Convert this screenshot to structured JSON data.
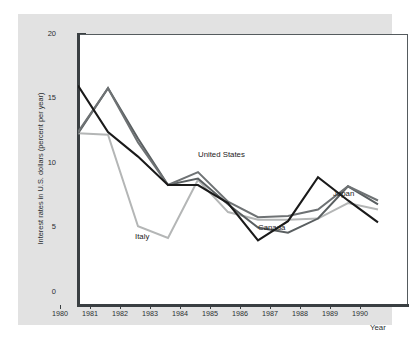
{
  "chart_data": {
    "type": "line",
    "title": "",
    "xlabel": "Year",
    "ylabel": "Interest rates in U.S. dollars (percent per year)",
    "x": [
      1980,
      1981,
      1982,
      1983,
      1984,
      1985,
      1986,
      1987,
      1988,
      1989,
      1990
    ],
    "xtick_labels": [
      "1980",
      "1981",
      "1982",
      "1983",
      "1984",
      "1985",
      "1986",
      "1987",
      "1988",
      "1989",
      "1990"
    ],
    "ytick_labels": [
      "0",
      "5",
      "10",
      "15",
      "20"
    ],
    "ytick_values": [
      0,
      5,
      10,
      15,
      20
    ],
    "xlim": [
      1980,
      1990
    ],
    "ylim": [
      0,
      21
    ],
    "grid": false,
    "legend": "inline-annotations",
    "series": [
      {
        "name": "Japan",
        "color": "#1a1a1a",
        "values": [
          17.0,
          13.4,
          11.5,
          9.3,
          9.3,
          7.9,
          5.0,
          6.5,
          9.9,
          8.1,
          6.4
        ],
        "label_x": 1989.1,
        "label_y": 7.55
      },
      {
        "name": "United States",
        "color": "#6e7274",
        "values": [
          13.4,
          16.8,
          12.6,
          9.3,
          10.3,
          8.0,
          6.8,
          6.9,
          7.4,
          9.2,
          8.1
        ],
        "label_x": 1984.6,
        "label_y": 10.55
      },
      {
        "name": "Canada",
        "color": "#5a5f61",
        "values": [
          13.3,
          16.8,
          12.9,
          9.3,
          9.8,
          7.8,
          6.0,
          5.6,
          6.7,
          9.2,
          7.8
        ],
        "label_x": 1986.6,
        "label_y": 4.9
      },
      {
        "name": "Italy",
        "color": "#b4b6b6",
        "values": [
          13.3,
          13.2,
          6.1,
          5.2,
          9.7,
          7.2,
          6.6,
          6.6,
          6.7,
          7.9,
          7.4
        ],
        "label_x": 1982.5,
        "label_y": 4.2
      }
    ]
  },
  "figure": {
    "panel_color": "#e2e2e2",
    "plot_background": "#ffffff",
    "axis_color": "#3a3f42",
    "frame_color": "#555b5e",
    "text_color": "#2b2f31"
  },
  "axis": {
    "y_label": "Interest rates in U.S. dollars (percent per year)",
    "x_label": "Year"
  }
}
